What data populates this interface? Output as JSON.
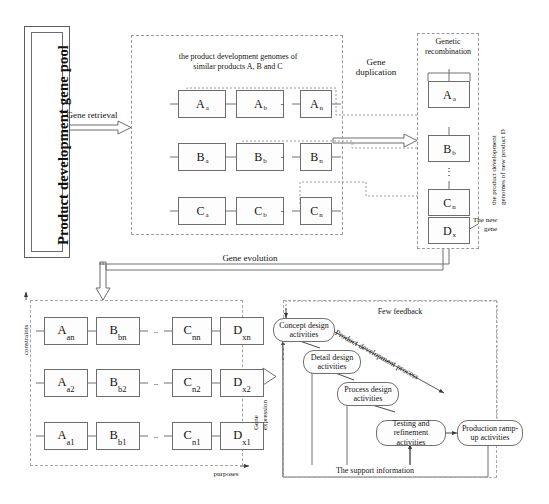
{
  "figure": {
    "title_block": {
      "label": "Product development gene pool"
    },
    "flow_labels": {
      "gene_retrieval": "Gene retrieval",
      "gene_duplication_l1": "Gene",
      "gene_duplication_l2": "duplication",
      "gene_evolution": "Gene evolution",
      "gene_expression_l1": "Gene",
      "gene_expression_l2": "expression",
      "the_new_gene_l1": "The new",
      "the_new_gene_l2": "gene"
    },
    "similar_genomes_panel": {
      "caption_l1": "the product development genomes of",
      "caption_l2": "similar products A, B and C",
      "ellipsis": "-",
      "rows": [
        {
          "name": "row-A",
          "cells": [
            {
              "base": "A",
              "sub": "a"
            },
            {
              "base": "A",
              "sub": "b"
            },
            {
              "base": "A",
              "sub": "n"
            }
          ]
        },
        {
          "name": "row-B",
          "cells": [
            {
              "base": "B",
              "sub": "a"
            },
            {
              "base": "B",
              "sub": "b"
            },
            {
              "base": "B",
              "sub": "n"
            }
          ]
        },
        {
          "name": "row-C",
          "cells": [
            {
              "base": "C",
              "sub": "a"
            },
            {
              "base": "C",
              "sub": "b"
            },
            {
              "base": "C",
              "sub": "n"
            }
          ]
        }
      ]
    },
    "recombination_panel": {
      "caption_l1": "Genetic",
      "caption_l2": "recombination",
      "side_caption_l1": "the product development",
      "side_caption_l2": "genomes of new product D",
      "cells": [
        {
          "base": "A",
          "sub": "a"
        },
        {
          "base": "B",
          "sub": "b"
        },
        {
          "base": "C",
          "sub": "n"
        },
        {
          "base": "D",
          "sub": "x"
        }
      ],
      "vertical_ellipsis": "⋮"
    },
    "genome_matrix_panel": {
      "axis_y": "constraints",
      "axis_x": "purposes",
      "ellipsis": "--",
      "rows": [
        {
          "name": "row-n",
          "cells": [
            {
              "base": "A",
              "sub": "an"
            },
            {
              "base": "B",
              "sub": "bn"
            },
            {
              "base": "C",
              "sub": "nn"
            },
            {
              "base": "D",
              "sub": "xn"
            }
          ]
        },
        {
          "name": "row-2",
          "cells": [
            {
              "base": "A",
              "sub": "a2"
            },
            {
              "base": "B",
              "sub": "b2"
            },
            {
              "base": "C",
              "sub": "n2"
            },
            {
              "base": "D",
              "sub": "x2"
            }
          ]
        },
        {
          "name": "row-1",
          "cells": [
            {
              "base": "A",
              "sub": "a1"
            },
            {
              "base": "B",
              "sub": "b1"
            },
            {
              "base": "C",
              "sub": "n1"
            },
            {
              "base": "D",
              "sub": "x1"
            }
          ]
        }
      ]
    },
    "process_panel": {
      "few_feedback": "Few feedback",
      "process_diagonal": "Product development process",
      "support_information": "The support information",
      "activities": [
        {
          "id": "concept-design",
          "l1": "Concept design",
          "l2": "activities"
        },
        {
          "id": "detail-design",
          "l1": "Detail design",
          "l2": "activities"
        },
        {
          "id": "process-design",
          "l1": "Process design",
          "l2": "activities"
        },
        {
          "id": "testing-refinement",
          "l1": "Testing and",
          "l2": "refinement activities"
        },
        {
          "id": "production-rampup",
          "l1": "Production ramp-",
          "l2": "up activities"
        }
      ]
    }
  },
  "colors": {
    "ink": "#141414",
    "stroke": "#707070",
    "dashed": "#9a9a9a",
    "background": "#ffffff"
  }
}
